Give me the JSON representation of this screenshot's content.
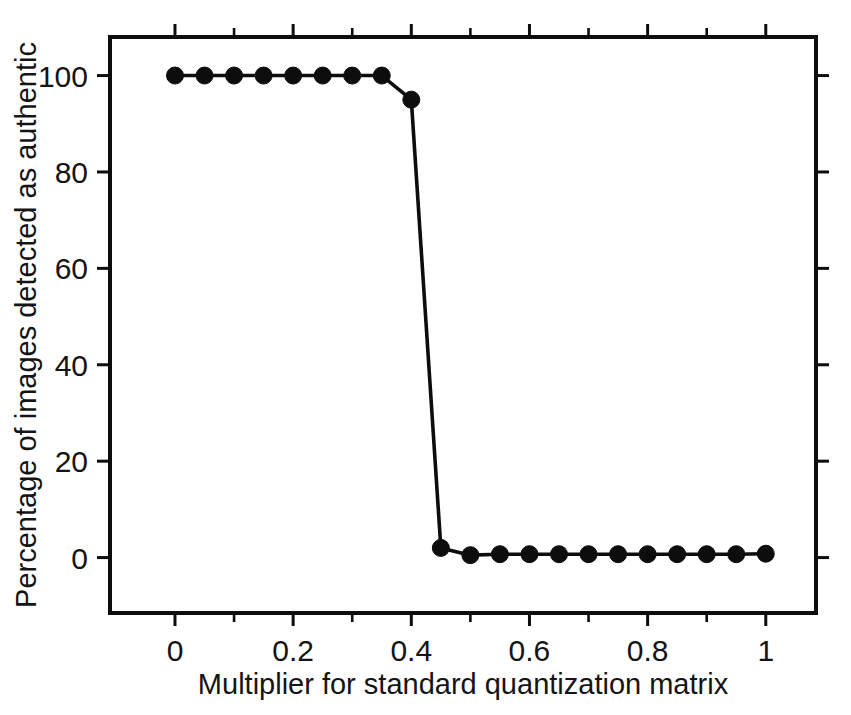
{
  "chart_data": {
    "type": "line",
    "title": "",
    "subtitle": "",
    "xlabel": "Multiplier for standard quantization matrix",
    "ylabel": "Percentage of images detected as authentic",
    "xlim": [
      -0.11,
      1.085
    ],
    "ylim": [
      -11.5,
      108
    ],
    "grid": false,
    "legend": null,
    "legend_position": "none",
    "xticks": [
      0,
      0.2,
      0.4,
      0.6,
      0.8,
      1
    ],
    "xtick_labels": [
      "0",
      "0.2",
      "0.4",
      "0.6",
      "0.8",
      "1"
    ],
    "xticks_minor": [
      0.1,
      0.3,
      0.5,
      0.7,
      0.9
    ],
    "yticks": [
      0,
      20,
      40,
      60,
      80,
      100
    ],
    "ytick_labels": [
      "0",
      "20",
      "40",
      "60",
      "80",
      "100"
    ],
    "marker": "filled-circle",
    "line_color": "#0d0d0d",
    "marker_color": "#0d0d0d",
    "x": [
      0,
      0.05,
      0.1,
      0.15,
      0.2,
      0.25,
      0.3,
      0.35,
      0.4,
      0.45,
      0.5,
      0.55,
      0.6,
      0.65,
      0.7,
      0.75,
      0.8,
      0.85,
      0.9,
      0.95,
      1
    ],
    "values": [
      100,
      100,
      100,
      100,
      100,
      100,
      100,
      100,
      95,
      2,
      0.5,
      0.7,
      0.7,
      0.7,
      0.7,
      0.7,
      0.7,
      0.7,
      0.7,
      0.7,
      0.8
    ],
    "series": [
      {
        "name": "Percentage of images detected as authentic",
        "x": [
          0,
          0.05,
          0.1,
          0.15,
          0.2,
          0.25,
          0.3,
          0.35,
          0.4,
          0.45,
          0.5,
          0.55,
          0.6,
          0.65,
          0.7,
          0.75,
          0.8,
          0.85,
          0.9,
          0.95,
          1
        ],
        "values": [
          100,
          100,
          100,
          100,
          100,
          100,
          100,
          100,
          95,
          2,
          0.5,
          0.7,
          0.7,
          0.7,
          0.7,
          0.7,
          0.7,
          0.7,
          0.7,
          0.7,
          0.8
        ]
      }
    ]
  }
}
